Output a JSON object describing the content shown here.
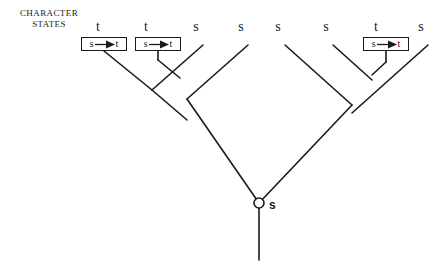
{
  "legend": {
    "line1": "CHARACTER",
    "line2": "STATES"
  },
  "colors": {
    "ink": "#1a1a1a",
    "background": "#ffffff"
  },
  "tips": [
    {
      "id": "tip-1",
      "label": "t",
      "x": 98,
      "y": 31
    },
    {
      "id": "tip-2",
      "label": "t",
      "x": 146,
      "y": 31
    },
    {
      "id": "tip-3",
      "label": "s",
      "x": 196,
      "y": 31
    },
    {
      "id": "tip-4",
      "label": "s",
      "x": 241,
      "y": 31
    },
    {
      "id": "tip-5",
      "label": "s",
      "x": 278,
      "y": 31
    },
    {
      "id": "tip-6",
      "label": "s",
      "x": 326,
      "y": 31
    },
    {
      "id": "tip-7",
      "label": "t",
      "x": 376,
      "y": 31
    },
    {
      "id": "tip-8",
      "label": "s",
      "x": 421,
      "y": 31
    }
  ],
  "transitions": [
    {
      "id": "transition-1",
      "from": "s",
      "to": "t",
      "x": 81,
      "y": 37,
      "width": 46
    },
    {
      "id": "transition-2",
      "from": "s",
      "to": "t",
      "x": 135,
      "y": 37,
      "width": 46
    },
    {
      "id": "transition-3",
      "from": "s",
      "to": "t",
      "x": 363,
      "y": 37,
      "width": 46
    }
  ],
  "root": {
    "state_label": "s",
    "circle_x": 259,
    "circle_y": 203,
    "circle_r": 5,
    "label_x": 269,
    "label_y": 198
  },
  "branches": [
    {
      "id": "branch-tip-1",
      "x1": 104,
      "y1": 51,
      "x2": 152,
      "y2": 90
    },
    {
      "id": "branch-tip-2",
      "x1": 158,
      "y1": 51,
      "x2": 158,
      "y2": 60
    },
    {
      "id": "branch-node-a",
      "x1": 158,
      "y1": 60,
      "x2": 180,
      "y2": 78
    },
    {
      "id": "branch-tip-3",
      "x1": 203,
      "y1": 45,
      "x2": 152,
      "y2": 90
    },
    {
      "id": "branch-node-b",
      "x1": 152,
      "y1": 90,
      "x2": 187,
      "y2": 120
    },
    {
      "id": "branch-tip-4",
      "x1": 248,
      "y1": 45,
      "x2": 187,
      "y2": 99
    },
    {
      "id": "branch-left-stem",
      "x1": 187,
      "y1": 99,
      "x2": 259,
      "y2": 203
    },
    {
      "id": "branch-tip-5",
      "x1": 285,
      "y1": 45,
      "x2": 352,
      "y2": 105
    },
    {
      "id": "branch-tip-6",
      "x1": 333,
      "y1": 45,
      "x2": 372,
      "y2": 80
    },
    {
      "id": "branch-tip-7",
      "x1": 386,
      "y1": 51,
      "x2": 386,
      "y2": 62
    },
    {
      "id": "branch-node-c",
      "x1": 386,
      "y1": 62,
      "x2": 372,
      "y2": 75
    },
    {
      "id": "branch-tip-8",
      "x1": 428,
      "y1": 45,
      "x2": 352,
      "y2": 113
    },
    {
      "id": "branch-right-stem",
      "x1": 352,
      "y1": 105,
      "x2": 259,
      "y2": 203
    },
    {
      "id": "branch-root-stem",
      "x1": 259,
      "y1": 208,
      "x2": 259,
      "y2": 260
    }
  ]
}
